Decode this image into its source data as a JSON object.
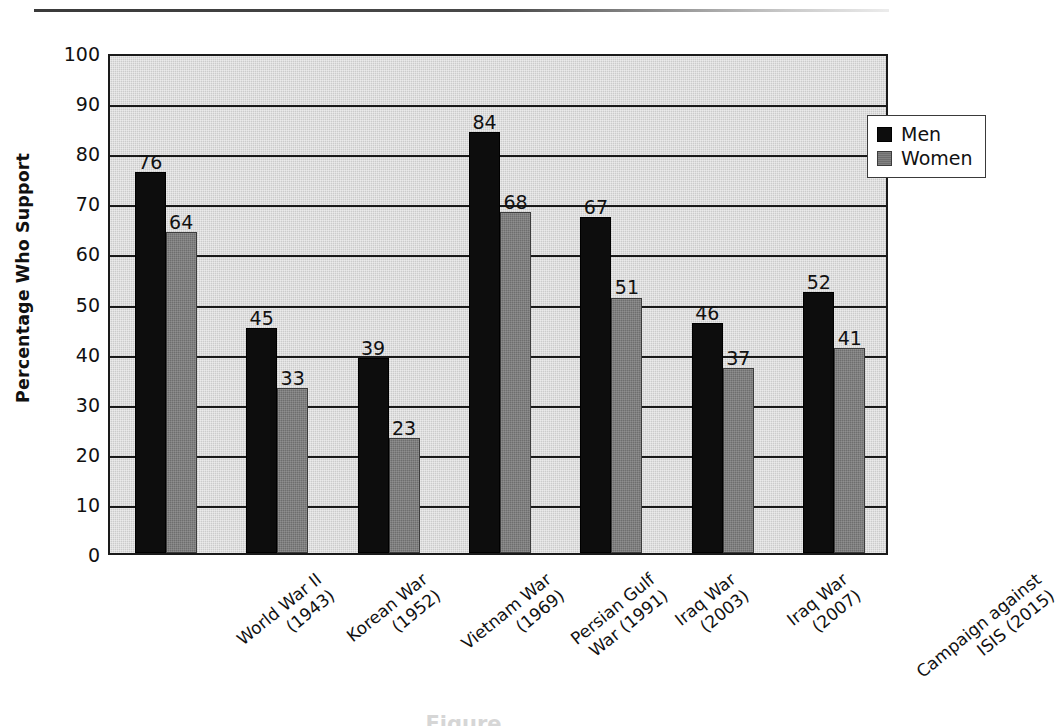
{
  "chart_data": {
    "type": "bar",
    "title": "",
    "xlabel": "",
    "ylabel": "Percentage Who Support",
    "ylim": [
      0,
      100
    ],
    "ytick_step": 10,
    "yticks": [
      0,
      10,
      20,
      30,
      40,
      50,
      60,
      70,
      80,
      90,
      100
    ],
    "grid": true,
    "grid_axis": "y",
    "legend_position": "top-right",
    "categories": [
      "World War II (1943)",
      "Korean War (1952)",
      "Vietnam War (1969)",
      "Persian Gulf War (1991)",
      "Iraq War (2003)",
      "Iraq War (2007)",
      "Campaign against ISIS (2015)"
    ],
    "category_lines": [
      [
        "World War II",
        "(1943)"
      ],
      [
        "Korean War",
        "(1952)"
      ],
      [
        "Vietnam War",
        "(1969)"
      ],
      [
        "Persian Gulf",
        "War (1991)"
      ],
      [
        "Iraq War",
        "(2003)"
      ],
      [
        "Iraq War",
        "(2007)"
      ],
      [
        "Campaign against",
        "ISIS (2015)"
      ]
    ],
    "series": [
      {
        "name": "Men",
        "color": "#0d0d0d",
        "values": [
          76,
          45,
          39,
          84,
          67,
          46,
          52
        ]
      },
      {
        "name": "Women",
        "color": "#6e6e6e",
        "values": [
          64,
          33,
          23,
          68,
          51,
          37,
          41
        ]
      }
    ]
  },
  "legend": {
    "entries": [
      {
        "label": "Men"
      },
      {
        "label": "Women"
      }
    ]
  },
  "axis": {
    "y_title": "Percentage Who Support"
  },
  "colors": {
    "men": "#0d0d0d",
    "women": "#6e6e6e",
    "plot_background": "#cbcbcb",
    "axis": "#1a1a1a",
    "page_background": "#ffffff"
  },
  "bottom_caption": "Figure"
}
